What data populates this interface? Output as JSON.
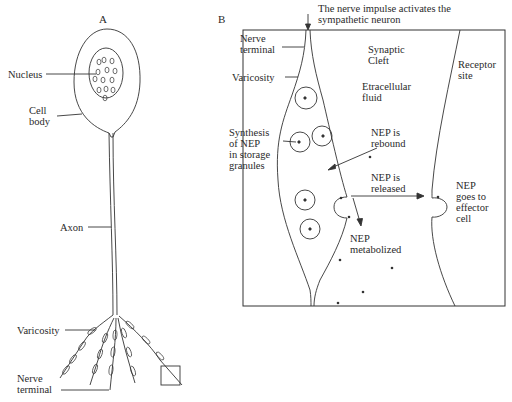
{
  "panel_a": {
    "title": "A",
    "labels": {
      "nucleus": "Nucleus",
      "cell_body": "Cell\nbody",
      "axon": "Axon",
      "varicosity": "Varicosity",
      "nerve_terminal": "Nerve\nterminal"
    }
  },
  "panel_b": {
    "title": "B",
    "caption": "The nerve impulse activates the\nsympathetic neuron",
    "labels": {
      "nerve_terminal": "Nerve\nterminal",
      "varicosity": "Varicosity",
      "synthesis": "Synthesis\nof NEP\nin storage\ngranules",
      "synaptic_cleft": "Synaptic\nCleft",
      "extracellular_fluid": "Etracellular\nfluid",
      "receptor_site": "Receptor\nsite",
      "nep_rebound": "NEP is\nrebound",
      "nep_released": "NEP is\nreleased",
      "nep_metabolized": "NEP\nmetabolized",
      "nep_effector": "NEP\ngoes to\neffector\ncell"
    }
  },
  "colors": {
    "line": "#333333",
    "background": "#ffffff"
  }
}
